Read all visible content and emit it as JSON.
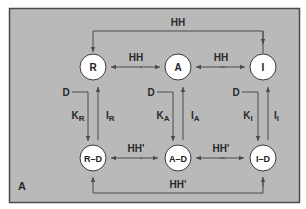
{
  "diagram": {
    "panel_label": "A",
    "colors": {
      "panel_fill": "#b9b9b9",
      "panel_border": "#4a4a4a",
      "line": "#4a4a4a",
      "node_fill": "#ffffff",
      "node_stroke": "#3a3a3a",
      "text": "#2a2a2a"
    },
    "nodes": {
      "R": "R",
      "A": "A",
      "I": "I",
      "RD": "R–D",
      "AD": "A–D",
      "ID": "I–D"
    },
    "edges": {
      "top_bracket": "HH",
      "R_A": "HH",
      "A_I": "HH",
      "RD_AD": "HH'",
      "AD_ID": "HH'",
      "bottom_bracket": "HH'"
    },
    "ligand_labels": {
      "R": "D",
      "A": "D",
      "I": "D"
    },
    "rate_labels": {
      "K_R": {
        "main": "K",
        "sub": "R"
      },
      "I_R": {
        "main": "I",
        "sub": "R"
      },
      "K_A": {
        "main": "K",
        "sub": "A"
      },
      "I_A": {
        "main": "I",
        "sub": "A"
      },
      "K_I": {
        "main": "K",
        "sub": "I"
      },
      "I_I": {
        "main": "I",
        "sub": "I"
      }
    }
  }
}
